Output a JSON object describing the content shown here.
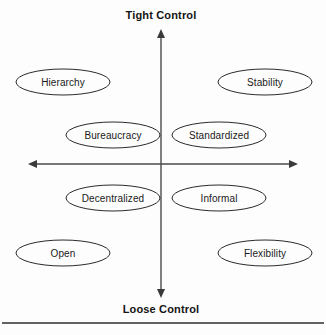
{
  "diagram": {
    "background_color": "#fdfdfd",
    "stroke_color": "#2b2b2b",
    "text_color": "#1a1a1a",
    "axis_color": "#4a4a4a",
    "axes": {
      "vertical": {
        "top_label": "Tight Control",
        "bottom_label": "Loose Control",
        "x": 161,
        "top_y": 30,
        "bottom_y": 297
      },
      "horizontal": {
        "y": 164,
        "left_x": 29,
        "right_x": 297
      }
    },
    "nodes": [
      {
        "id": "hierarchy",
        "label": "Hierarchy",
        "cx": 63,
        "cy": 82,
        "rx": 47,
        "ry": 13
      },
      {
        "id": "stability",
        "label": "Stability",
        "cx": 265,
        "cy": 82,
        "rx": 47,
        "ry": 13
      },
      {
        "id": "bureaucracy",
        "label": "Bureaucracy",
        "cx": 113,
        "cy": 135,
        "rx": 47,
        "ry": 13
      },
      {
        "id": "standardized",
        "label": "Standardized",
        "cx": 219,
        "cy": 135,
        "rx": 47,
        "ry": 13
      },
      {
        "id": "decentralized",
        "label": "Decentralized",
        "cx": 113,
        "cy": 198,
        "rx": 47,
        "ry": 13
      },
      {
        "id": "informal",
        "label": "Informal",
        "cx": 219,
        "cy": 198,
        "rx": 47,
        "ry": 13
      },
      {
        "id": "open",
        "label": "Open",
        "cx": 63,
        "cy": 253,
        "rx": 47,
        "ry": 13
      },
      {
        "id": "flexibility",
        "label": "Flexibility",
        "cx": 265,
        "cy": 253,
        "rx": 47,
        "ry": 13
      }
    ],
    "footer_rule": {
      "y": 323,
      "x1": 2,
      "x2": 324
    }
  }
}
